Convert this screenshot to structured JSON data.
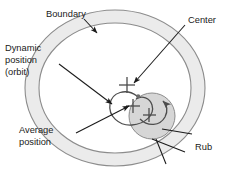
{
  "figure": {
    "type": "annotated-diagram",
    "colors": {
      "annulus_fill": "#ebebeb",
      "annulus_stroke": "#8c8c8c",
      "rub_circle_fill": "#d6d6d6",
      "rub_circle_stroke": "#8c8c8c",
      "orbit_stroke": "#4d4d4d",
      "leader_stroke": "#1a1a1a",
      "text": "#1a1a1a",
      "background": "#ffffff"
    }
  },
  "labels": {
    "boundary": "Boundary",
    "center": "Center",
    "dynamic_position_line1": "Dynamic",
    "dynamic_position_line2": "position",
    "dynamic_position_line3": "(orbit)",
    "average_position_line1": "Average",
    "average_position_line2": "position",
    "rub": "Rub"
  },
  "markers": {
    "center_cross": "cross-marker",
    "average_cross": "cross-marker",
    "rub_cross": "cross-marker",
    "orbit_endpoint_dot": "dot-marker",
    "rotation_arrow": "curved-arrow"
  }
}
